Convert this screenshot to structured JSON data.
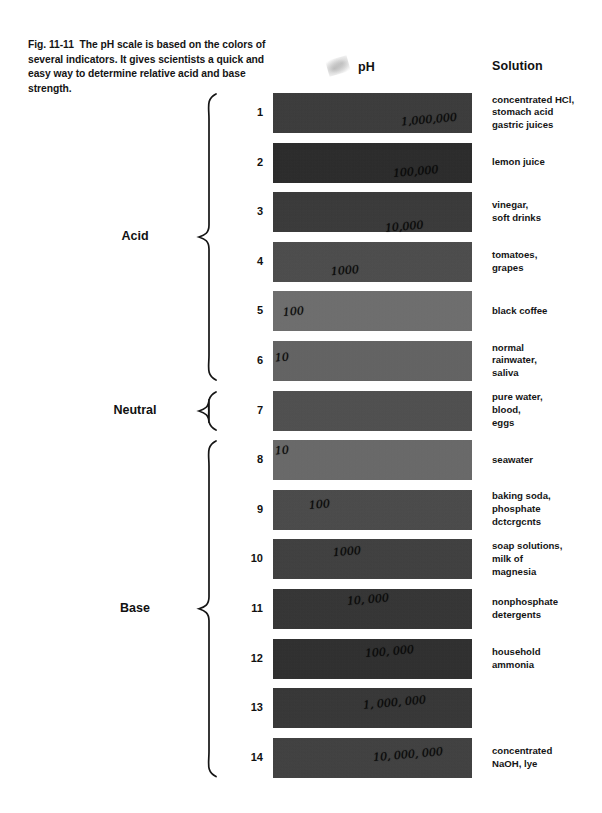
{
  "caption": {
    "figure_number": "Fig. 11-11",
    "text": "The pH scale is based on the colors of several indicators. It gives scientists a quick and easy way to determine relative acid and base strength."
  },
  "headers": {
    "ph": "pH",
    "solution": "Solution"
  },
  "groups": [
    {
      "label": "Acid",
      "from": 1,
      "to": 6
    },
    {
      "label": "Neutral",
      "from": 7,
      "to": 7
    },
    {
      "label": "Base",
      "from": 8,
      "to": 14
    }
  ],
  "chart_data": {
    "type": "table",
    "title": "The pH scale",
    "columns": [
      "pH",
      "Color",
      "Solution"
    ],
    "rows": [
      {
        "ph": "1",
        "color": "#3b3b3b",
        "note": "1,000,000",
        "solution": "concentrated HCl,\nstomach acid\ngastric juices"
      },
      {
        "ph": "2",
        "color": "#2a2a2a",
        "note": "100,000",
        "solution": "lemon juice"
      },
      {
        "ph": "3",
        "color": "#393939",
        "note": "10,000",
        "solution": "vinegar,\nsoft drinks"
      },
      {
        "ph": "4",
        "color": "#4c4c4c",
        "note": "1000",
        "solution": "tomatoes,\ngrapes"
      },
      {
        "ph": "5",
        "color": "#6e6e6e",
        "note": "100",
        "solution": "black coffee"
      },
      {
        "ph": "6",
        "color": "#636363",
        "note": "10",
        "solution": "normal\nrainwater,\nsaliva"
      },
      {
        "ph": "7",
        "color": "#4f4f4f",
        "note": "",
        "solution": "pure water,\nblood,\neggs"
      },
      {
        "ph": "8",
        "color": "#696969",
        "note": "10",
        "solution": "seawater"
      },
      {
        "ph": "9",
        "color": "#4a4a4a",
        "note": "100",
        "solution": "baking soda,\nphosphate\ndctcrgcnts"
      },
      {
        "ph": "10",
        "color": "#3f3f3f",
        "note": "1000",
        "solution": "soap solutions,\nmilk of\nmagnesia"
      },
      {
        "ph": "11",
        "color": "#343434",
        "note": "10, 000",
        "solution": "nonphosphate\ndetergents"
      },
      {
        "ph": "12",
        "color": "#2e2e2e",
        "note": "100, 000",
        "solution": "household\nammonia"
      },
      {
        "ph": "13",
        "color": "#363636",
        "note": "1, 000, 000",
        "solution": ""
      },
      {
        "ph": "14",
        "color": "#404040",
        "note": "10, 000, 000",
        "solution": "concentrated\nNaOH, lye"
      }
    ],
    "xlabel": "",
    "ylabel": "pH",
    "legend": []
  }
}
